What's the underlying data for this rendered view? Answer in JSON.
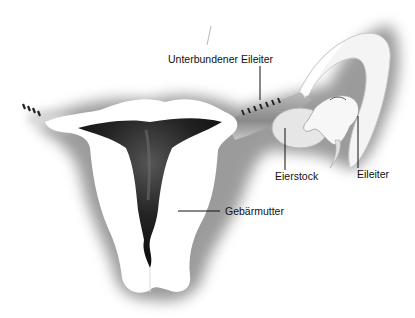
{
  "diagram": {
    "type": "anatomical-illustration",
    "labels": {
      "ligated_tube": "Unterbundener Eileiter",
      "ovary": "Eierstock",
      "fallopian_tube": "Eileiter",
      "uterus": "Gebärmutter"
    },
    "colors": {
      "background": "#ffffff",
      "organ_fill": "#ffffff",
      "shadow": "#8a8a8a",
      "cavity": "#1a1a1a",
      "ligature": "#222222",
      "leader_line": "#111111"
    }
  }
}
